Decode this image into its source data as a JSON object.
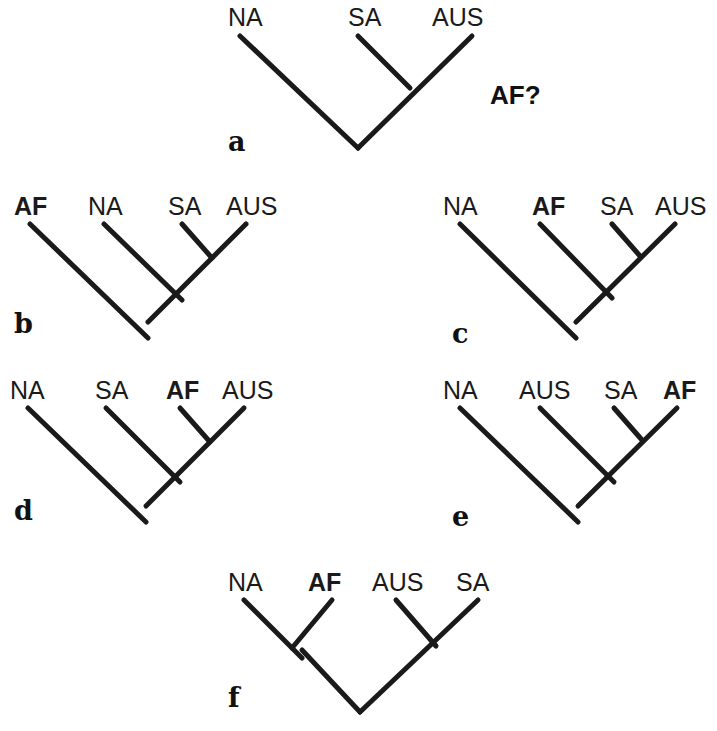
{
  "figure": {
    "background_color": "#ffffff",
    "line_color": "#1a1a1a",
    "line_width": 5
  },
  "panels": [
    {
      "id": "a",
      "letter": "a",
      "letter_x": 228,
      "letter_y": 128,
      "tips": [
        {
          "label": "NA",
          "bold": false,
          "x": 228,
          "y": 5
        },
        {
          "label": "SA",
          "bold": false,
          "x": 348,
          "y": 5
        },
        {
          "label": "AUS",
          "bold": false,
          "x": 432,
          "y": 5
        },
        {
          "label": "AF?",
          "bold": true,
          "x": 490,
          "y": 82,
          "annotation": true
        }
      ],
      "strokes": [
        {
          "name": "na-branch",
          "x1": 240,
          "y1": 36,
          "x2": 358,
          "y2": 148
        },
        {
          "name": "aus-branch",
          "x1": 472,
          "y1": 36,
          "x2": 358,
          "y2": 148
        },
        {
          "name": "sa-branch",
          "x1": 358,
          "y1": 36,
          "x2": 410,
          "y2": 88
        }
      ]
    },
    {
      "id": "b",
      "letter": "b",
      "letter_x": 14,
      "letter_y": 310,
      "tips": [
        {
          "label": "AF",
          "bold": true,
          "x": 14,
          "y": 194
        },
        {
          "label": "NA",
          "bold": false,
          "x": 88,
          "y": 194
        },
        {
          "label": "SA",
          "bold": false,
          "x": 168,
          "y": 194
        },
        {
          "label": "AUS",
          "bold": false,
          "x": 226,
          "y": 194
        }
      ],
      "strokes": [
        {
          "name": "af-branch",
          "x1": 30,
          "y1": 224,
          "x2": 148,
          "y2": 338
        },
        {
          "name": "na-branch",
          "x1": 104,
          "y1": 224,
          "x2": 182,
          "y2": 300
        },
        {
          "name": "sa-branch",
          "x1": 182,
          "y1": 224,
          "x2": 212,
          "y2": 258
        },
        {
          "name": "aus-branch",
          "x1": 246,
          "y1": 224,
          "x2": 148,
          "y2": 322
        }
      ]
    },
    {
      "id": "c",
      "letter": "c",
      "letter_x": 452,
      "letter_y": 320,
      "tips": [
        {
          "label": "NA",
          "bold": false,
          "x": 443,
          "y": 194
        },
        {
          "label": "AF",
          "bold": true,
          "x": 532,
          "y": 194
        },
        {
          "label": "SA",
          "bold": false,
          "x": 600,
          "y": 194
        },
        {
          "label": "AUS",
          "bold": false,
          "x": 655,
          "y": 194
        }
      ],
      "strokes": [
        {
          "name": "na-branch",
          "x1": 460,
          "y1": 224,
          "x2": 576,
          "y2": 338
        },
        {
          "name": "af-branch",
          "x1": 540,
          "y1": 224,
          "x2": 612,
          "y2": 298
        },
        {
          "name": "sa-branch",
          "x1": 612,
          "y1": 224,
          "x2": 640,
          "y2": 256
        },
        {
          "name": "aus-branch",
          "x1": 675,
          "y1": 224,
          "x2": 576,
          "y2": 322
        }
      ]
    },
    {
      "id": "d",
      "letter": "d",
      "letter_x": 14,
      "letter_y": 497,
      "tips": [
        {
          "label": "NA",
          "bold": false,
          "x": 10,
          "y": 378
        },
        {
          "label": "SA",
          "bold": false,
          "x": 95,
          "y": 378
        },
        {
          "label": "AF",
          "bold": true,
          "x": 166,
          "y": 378
        },
        {
          "label": "AUS",
          "bold": false,
          "x": 222,
          "y": 378
        }
      ],
      "strokes": [
        {
          "name": "na-branch",
          "x1": 28,
          "y1": 408,
          "x2": 146,
          "y2": 522
        },
        {
          "name": "sa-branch",
          "x1": 106,
          "y1": 408,
          "x2": 180,
          "y2": 482
        },
        {
          "name": "af-branch",
          "x1": 180,
          "y1": 408,
          "x2": 210,
          "y2": 442
        },
        {
          "name": "aus-branch",
          "x1": 244,
          "y1": 408,
          "x2": 146,
          "y2": 506
        }
      ]
    },
    {
      "id": "e",
      "letter": "e",
      "letter_x": 452,
      "letter_y": 503,
      "tips": [
        {
          "label": "NA",
          "bold": false,
          "x": 443,
          "y": 378
        },
        {
          "label": "AUS",
          "bold": false,
          "x": 519,
          "y": 378
        },
        {
          "label": "SA",
          "bold": false,
          "x": 604,
          "y": 378
        },
        {
          "label": "AF",
          "bold": true,
          "x": 663,
          "y": 378
        }
      ],
      "strokes": [
        {
          "name": "na-branch",
          "x1": 460,
          "y1": 408,
          "x2": 578,
          "y2": 522
        },
        {
          "name": "aus-branch",
          "x1": 540,
          "y1": 408,
          "x2": 614,
          "y2": 482
        },
        {
          "name": "sa-branch",
          "x1": 614,
          "y1": 408,
          "x2": 642,
          "y2": 440
        },
        {
          "name": "af-branch",
          "x1": 677,
          "y1": 408,
          "x2": 578,
          "y2": 506
        }
      ]
    },
    {
      "id": "f",
      "letter": "f",
      "letter_x": 228,
      "letter_y": 684,
      "tips": [
        {
          "label": "NA",
          "bold": false,
          "x": 228,
          "y": 570
        },
        {
          "label": "AF",
          "bold": true,
          "x": 308,
          "y": 570
        },
        {
          "label": "AUS",
          "bold": false,
          "x": 372,
          "y": 570
        },
        {
          "label": "SA",
          "bold": false,
          "x": 456,
          "y": 570
        }
      ],
      "strokes": [
        {
          "name": "na-branch",
          "x1": 244,
          "y1": 600,
          "x2": 302,
          "y2": 658
        },
        {
          "name": "af-branch",
          "x1": 332,
          "y1": 600,
          "x2": 292,
          "y2": 648
        },
        {
          "name": "clade1-stem",
          "x1": 302,
          "y1": 650,
          "x2": 360,
          "y2": 712
        },
        {
          "name": "aus-branch",
          "x1": 396,
          "y1": 600,
          "x2": 436,
          "y2": 646
        },
        {
          "name": "sa-branch",
          "x1": 478,
          "y1": 600,
          "x2": 360,
          "y2": 712
        }
      ]
    }
  ]
}
